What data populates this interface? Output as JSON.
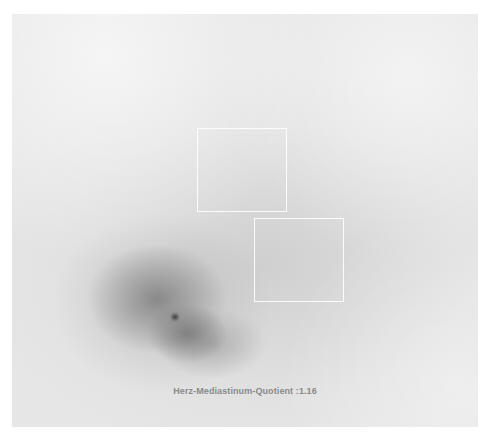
{
  "image": {
    "type": "scintigraphy",
    "description": "Planar nuclear medicine scan with heart uptake region and two ROI boxes"
  },
  "rois": [
    {
      "name": "roi-heart",
      "x": 197,
      "y": 128,
      "w": 90,
      "h": 84
    },
    {
      "name": "roi-mediastinum",
      "x": 254,
      "y": 218,
      "w": 90,
      "h": 84
    }
  ],
  "annotation": {
    "label": "Herz-Mediastinum-Quotient :1.16"
  },
  "colors": {
    "background": "#ffffff",
    "scan_base": "#e4e4e4",
    "roi_border": "#ffffff",
    "label_text": "#8a8a8a"
  }
}
